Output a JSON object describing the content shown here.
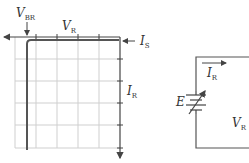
{
  "graph": {
    "labels": {
      "v_br": {
        "main": "V",
        "sub": "BR"
      },
      "v_r": {
        "main": "V",
        "sub": "R"
      },
      "i_s": {
        "main": "I",
        "sub": "S"
      },
      "i_r": {
        "main": "I",
        "sub": "R"
      }
    },
    "grid": {
      "columns": 5,
      "rows": 5
    },
    "colors": {
      "grid": "#c8c8c8",
      "axis": "#444444",
      "curve": "#555555"
    }
  },
  "circuit": {
    "labels": {
      "i_r": {
        "main": "I",
        "sub": "R"
      },
      "e": "E",
      "v_r": {
        "main": "V",
        "sub": "R"
      }
    }
  }
}
